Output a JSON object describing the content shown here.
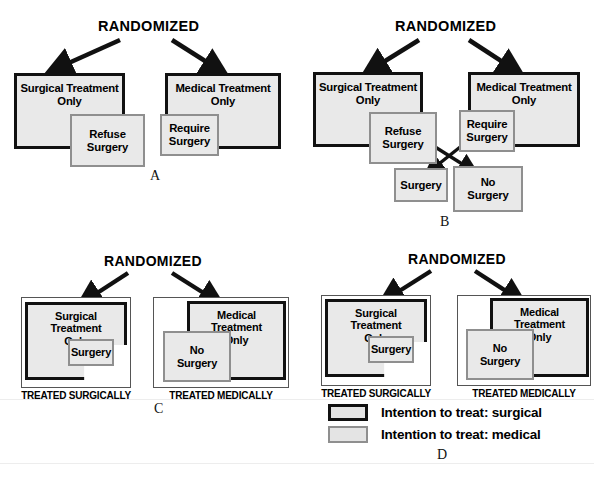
{
  "figure": {
    "title_text": "RANDOMIZED",
    "colors": {
      "box_fill": "#e9e9e9",
      "surgical_border": "#111111",
      "medical_border": "#8f8f8f",
      "outer_border": "#555555",
      "background": "#ffffff",
      "text": "#000000"
    }
  },
  "panels": [
    {
      "letter": "A",
      "randomized": "RANDOMIZED",
      "boxes": [
        {
          "id": "a-surgical",
          "label": "Surgical Treatment\nOnly",
          "intention": "surgical"
        },
        {
          "id": "a-refuse",
          "label": "Refuse\nSurgery",
          "intention": "medical"
        },
        {
          "id": "a-medical",
          "label": "Medical Treatment\nOnly",
          "intention": "surgical"
        },
        {
          "id": "a-require",
          "label": "Require\nSurgery",
          "intention": "medical"
        }
      ]
    },
    {
      "letter": "B",
      "randomized": "RANDOMIZED",
      "boxes": [
        {
          "id": "b-surgical",
          "label": "Surgical Treatment\nOnly",
          "intention": "surgical"
        },
        {
          "id": "b-refuse",
          "label": "Refuse\nSurgery",
          "intention": "medical"
        },
        {
          "id": "b-medical",
          "label": "Medical Treatment\nOnly",
          "intention": "surgical"
        },
        {
          "id": "b-require",
          "label": "Require\nSurgery",
          "intention": "medical"
        },
        {
          "id": "b-surgery",
          "label": "Surgery",
          "intention": "medical"
        },
        {
          "id": "b-nosurgery",
          "label": "No\nSurgery",
          "intention": "medical"
        }
      ]
    },
    {
      "letter": "C",
      "randomized": "RANDOMIZED",
      "group_labels": [
        "TREATED SURGICALLY",
        "TREATED MEDICALLY"
      ],
      "boxes": [
        {
          "id": "c-surgical",
          "label": "Surgical Treatment\nOnly",
          "intention": "surgical"
        },
        {
          "id": "c-surgery",
          "label": "Surgery",
          "intention": "medical"
        },
        {
          "id": "c-medical",
          "label": "Medical Treatment\nOnly",
          "intention": "surgical"
        },
        {
          "id": "c-nosurgery",
          "label": "No\nSurgery",
          "intention": "medical"
        }
      ]
    },
    {
      "letter": "D",
      "randomized": "RANDOMIZED",
      "group_labels": [
        "TREATED SURGICALLY",
        "TREATED MEDICALLY"
      ],
      "boxes": [
        {
          "id": "d-surgical",
          "label": "Surgical Treatment\nOnly",
          "intention": "surgical"
        },
        {
          "id": "d-surgery",
          "label": "Surgery",
          "intention": "medical"
        },
        {
          "id": "d-medical",
          "label": "Medical Treatment\nOnly",
          "intention": "surgical"
        },
        {
          "id": "d-nosurgery",
          "label": "No\nSurgery",
          "intention": "medical"
        }
      ]
    }
  ],
  "legend": {
    "items": [
      {
        "swatch": "surgical",
        "label": "Intention to treat: surgical"
      },
      {
        "swatch": "medical",
        "label": "Intention to treat: medical"
      }
    ]
  },
  "labels": {
    "treated_surgically": "TREATED SURGICALLY",
    "treated_medically": "TREATED MEDICALLY",
    "panel_a": "A",
    "panel_b": "B",
    "panel_c": "C",
    "panel_d": "D"
  }
}
